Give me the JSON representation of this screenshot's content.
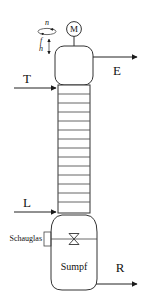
{
  "diagram": {
    "equipment": {
      "motor": {
        "symbol_label": "M",
        "name": "motor-symbol"
      },
      "top_vessel": {
        "name": "rotating-head-vessel"
      },
      "column": {
        "name": "tray-column",
        "tray_count": 13
      },
      "sump_vessel": {
        "name": "sump-vessel",
        "label": "Sumpf"
      },
      "sight_glass": {
        "label": "Schauglas",
        "name": "sight-glass"
      },
      "valve": {
        "name": "bowtie-valve"
      }
    },
    "parameters": [
      {
        "id": "n",
        "label": "n",
        "description": "rotation-speed"
      },
      {
        "id": "f",
        "label": "f",
        "description": "frequency"
      },
      {
        "id": "h",
        "label": "h",
        "description": "stroke-height"
      }
    ],
    "streams": [
      {
        "id": "T",
        "label": "T",
        "direction": "inlet",
        "side": "left",
        "name": "stream-T-inlet"
      },
      {
        "id": "L",
        "label": "L",
        "direction": "inlet",
        "side": "left",
        "name": "stream-L-inlet"
      },
      {
        "id": "E",
        "label": "E",
        "direction": "outlet",
        "side": "right",
        "name": "stream-E-outlet"
      },
      {
        "id": "R",
        "label": "R",
        "direction": "outlet",
        "side": "right",
        "name": "stream-R-outlet"
      }
    ],
    "colors": {
      "line": "#222222",
      "tray": "#555555",
      "text": "#111111",
      "background": "#ffffff"
    }
  }
}
